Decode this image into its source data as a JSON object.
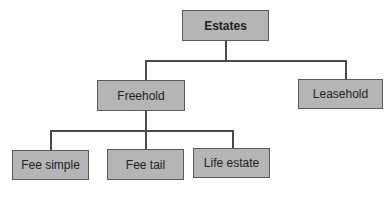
{
  "diagram": {
    "type": "tree",
    "root": {
      "label": "Estates"
    },
    "level1": [
      {
        "label": "Freehold"
      },
      {
        "label": "Leasehold"
      }
    ],
    "level2_freehold": [
      {
        "label": "Fee simple"
      },
      {
        "label": "Fee tail"
      },
      {
        "label": "Life estate"
      }
    ],
    "colors": {
      "box_fill": "#b5b5b5",
      "box_border": "#5a5a5a",
      "connector": "#4a4a4a"
    }
  }
}
